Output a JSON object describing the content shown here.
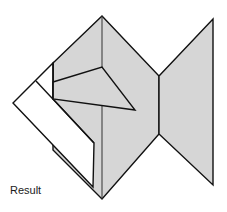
{
  "diagram": {
    "type": "origami-fold-step",
    "caption": "Result",
    "colors": {
      "paper_colored": "#d6d6d6",
      "paper_white": "#ffffff",
      "line": "#111111",
      "background": "#ffffff"
    },
    "shapes": {
      "body": "102,16 159,76 159,134 102,199 53,150 53,63",
      "tail": "159,76 213,19 213,185 159,134",
      "white_flap": "36,81 53,64 53,99 94,143 93,187 13,103",
      "white_strip_divider": "36,81 94,143",
      "fin_triangle": "53,82 102,67 135,110 53,99",
      "center_fold": "102,16 102,199",
      "inner_edge": "53,63 53,99"
    }
  }
}
